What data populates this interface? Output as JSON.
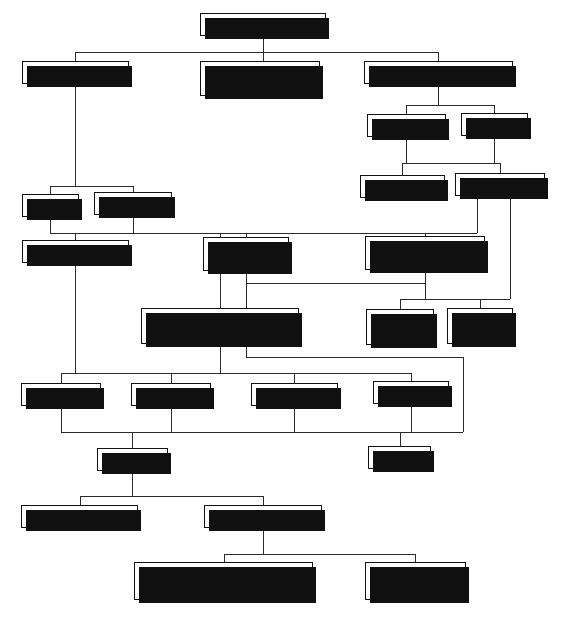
{
  "diagram": {
    "title": "System choice",
    "type": "flowchart",
    "width": 565,
    "height": 618,
    "line_color": "#2b2b2b",
    "box_border_color": "#111111",
    "box_fill_color": "#ffffff",
    "shadow_color": "#111111"
  },
  "nodes": [
    {
      "id": "system_choice",
      "label": "System choice",
      "x": 200,
      "y": 13,
      "w": 126,
      "h": 23
    },
    {
      "id": "storage_type",
      "label": "Storage type",
      "x": 22,
      "y": 61,
      "w": 107,
      "h": 23
    },
    {
      "id": "water_jacketed",
      "label": "Water-jacketed\ntube type",
      "x": 200,
      "y": 61,
      "w": 120,
      "h": 35
    },
    {
      "id": "instantaneous_type",
      "label": "Instantaneous type",
      "x": 364,
      "y": 61,
      "w": 149,
      "h": 23
    },
    {
      "id": "inst_gas_fired",
      "label": "Gas-fired",
      "x": 367,
      "y": 114,
      "w": 79,
      "h": 23
    },
    {
      "id": "inst_electric",
      "label": "Electric",
      "x": 461,
      "y": 113,
      "w": 67,
      "h": 23
    },
    {
      "id": "multi_point",
      "label": "Multi-point",
      "x": 360,
      "y": 175,
      "w": 85,
      "h": 23
    },
    {
      "id": "single_point",
      "label": "Single-point",
      "x": 455,
      "y": 173,
      "w": 90,
      "h": 23
    },
    {
      "id": "vented",
      "label": "Vented",
      "x": 22,
      "y": 194,
      "w": 57,
      "h": 23
    },
    {
      "id": "unvented",
      "label": "Unvented",
      "x": 94,
      "y": 192,
      "w": 78,
      "h": 23
    },
    {
      "id": "boiler_system",
      "label": "Boiler system",
      "x": 22,
      "y": 240,
      "w": 107,
      "h": 23
    },
    {
      "id": "gas_fired_heater",
      "label": "Gas-fired\nheater",
      "x": 203,
      "y": 237,
      "w": 86,
      "h": 34
    },
    {
      "id": "electric_water_heater",
      "label": "Electric water\nheater",
      "x": 365,
      "y": 236,
      "w": 120,
      "h": 34
    },
    {
      "id": "electric_immersion",
      "label": "Electric immersion\nheater in storage vessel",
      "x": 141,
      "y": 308,
      "w": 158,
      "h": 36
    },
    {
      "id": "inlet_control",
      "label": "Inlet\ncontrol",
      "x": 366,
      "y": 309,
      "w": 68,
      "h": 36
    },
    {
      "id": "outlet_control",
      "label": "Outlet\ncontrol",
      "x": 447,
      "y": 308,
      "w": 66,
      "h": 36
    },
    {
      "id": "boiler_gas_fired",
      "label": "Gas-fired",
      "x": 21,
      "y": 383,
      "w": 80,
      "h": 23
    },
    {
      "id": "boiler_oil_fired",
      "label": "Oil-fired",
      "x": 131,
      "y": 383,
      "w": 80,
      "h": 23
    },
    {
      "id": "boiler_solid_fuel",
      "label": "Solid fuel",
      "x": 251,
      "y": 383,
      "w": 87,
      "h": 23
    },
    {
      "id": "boiler_electric",
      "label": "Electric",
      "x": 373,
      "y": 381,
      "w": 76,
      "h": 23
    },
    {
      "id": "indirect",
      "label": "Indirect",
      "x": 97,
      "y": 448,
      "w": 71,
      "h": 23
    },
    {
      "id": "direct",
      "label": "Direct",
      "x": 368,
      "y": 446,
      "w": 63,
      "h": 23
    },
    {
      "id": "sealed_primary",
      "label": "Sealed primary",
      "x": 21,
      "y": 505,
      "w": 117,
      "h": 23
    },
    {
      "id": "vented_primary",
      "label": "Vented primary",
      "x": 204,
      "y": 505,
      "w": 118,
      "h": 23
    },
    {
      "id": "single_feed",
      "label": "Single feed (vented\nsecondary only)",
      "x": 134,
      "y": 562,
      "w": 179,
      "h": 38
    },
    {
      "id": "double_feed",
      "label": "Double feed",
      "x": 365,
      "y": 562,
      "w": 101,
      "h": 38
    }
  ],
  "connectors": [
    {
      "from": "system_choice",
      "to": "storage_type",
      "points": "263,36 263,52 75,52 75,61"
    },
    {
      "from": "system_choice",
      "to": "water_jacketed",
      "points": "263,36 263,61"
    },
    {
      "from": "system_choice",
      "to": "instantaneous_type",
      "points": "263,52 438,52 438,61"
    },
    {
      "from": "instantaneous_type",
      "to": "inst_gas_fired",
      "points": "438,84 438,105 406,105 406,114"
    },
    {
      "from": "instantaneous_type",
      "to": "inst_electric",
      "points": "438,105 494,105 494,113"
    },
    {
      "from": "inst_gas_fired",
      "to": "multi_point",
      "points": "406,137 406,163 402,163 402,175"
    },
    {
      "from": "inst_electric",
      "to": "single_point",
      "points": "494,136 494,163 500,163 500,173"
    },
    {
      "from": "inst_gas_fired",
      "to": "junction_inst",
      "points": "450,155 450,163"
    },
    {
      "from": "storage_type",
      "to": "vented",
      "points": "75,84 75,186 50,186 50,194"
    },
    {
      "from": "storage_type",
      "to": "unvented",
      "points": "75,186 133,186 133,192"
    },
    {
      "from": "vented",
      "to": "boiler_bus",
      "points": "50,217 50,233"
    },
    {
      "from": "unvented",
      "to": "boiler_bus",
      "points": "133,215 133,233"
    },
    {
      "from": "bus_main",
      "to": "row_heaters",
      "points": "50,233 477,233"
    },
    {
      "from": "bus_main",
      "to": "boiler_system",
      "points": "75,233 75,240"
    },
    {
      "from": "bus_main",
      "to": "gas_fired_heater",
      "points": "246,233 246,237"
    },
    {
      "from": "bus_main",
      "to": "electric_water_heater",
      "points": "425,233 425,236"
    },
    {
      "from": "bus_main",
      "to": "immersion_drop",
      "points": "220,233 220,380"
    },
    {
      "from": "gas_fired_heater",
      "to": "immersion_bus",
      "points": "246,271 246,283 425,283"
    },
    {
      "from": "electric_water_heater",
      "to": "immersion_bus",
      "points": "425,270 425,283"
    },
    {
      "from": "immersion_bus",
      "to": "electric_immersion",
      "points": "246,283 246,308"
    },
    {
      "from": "electric_water_heater",
      "to": "control_bus",
      "points": "425,270 425,299 400,299 400,309"
    },
    {
      "from": "control_bus",
      "to": "outlet_control",
      "points": "400,299 480,299 480,308"
    },
    {
      "from": "single_point",
      "to": "control_bus",
      "points": "500,196 500,299 480,299"
    },
    {
      "from": "electric_immersion",
      "to": "boiler_electric_side",
      "points": "220,344 220,358 460,358 460,432"
    },
    {
      "from": "boiler_system",
      "to": "fuel_bus",
      "points": "75,263 75,373"
    },
    {
      "from": "fuel_bus",
      "to": "row_fuels",
      "points": "61,373 411,373"
    },
    {
      "from": "fuel_bus",
      "to": "boiler_gas_fired",
      "points": "61,373 61,383"
    },
    {
      "from": "fuel_bus",
      "to": "boiler_oil_fired",
      "points": "171,373 171,383"
    },
    {
      "from": "fuel_bus",
      "to": "boiler_solid_fuel",
      "points": "294,373 294,383"
    },
    {
      "from": "fuel_bus",
      "to": "boiler_electric",
      "points": "411,373 411,381"
    },
    {
      "from": "boiler_gas_fired",
      "to": "indirect_bus",
      "points": "61,406 61,432 132,432"
    },
    {
      "from": "boiler_oil_fired",
      "to": "indirect_bus",
      "points": "171,406 171,432"
    },
    {
      "from": "boiler_solid_fuel",
      "to": "indirect_bus",
      "points": "294,406 294,432"
    },
    {
      "from": "indirect_bus",
      "to": "indirect",
      "points": "132,432 132,448"
    },
    {
      "from": "indirect_bus_span",
      "to": "direct",
      "points": "132,432 400,432 400,446"
    },
    {
      "from": "boiler_electric",
      "to": "direct_drop",
      "points": "411,404 411,432"
    },
    {
      "from": "indirect",
      "to": "primary_bus",
      "points": "132,471 132,515 80,515 80,505"
    },
    {
      "from": "primary_bus",
      "to": "vented_primary",
      "points": "132,515 263,515 263,505"
    },
    {
      "from": "vented_primary",
      "to": "feed_bus",
      "points": "263,528 263,556 224,556 224,562"
    },
    {
      "from": "feed_bus",
      "to": "double_feed",
      "points": "224,556 415,556 415,562"
    }
  ]
}
